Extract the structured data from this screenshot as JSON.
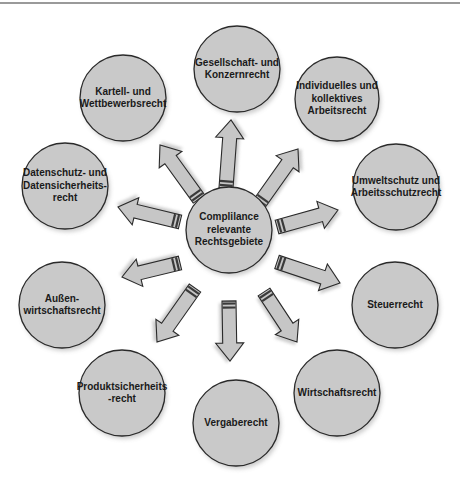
{
  "diagram": {
    "type": "hub-and-spoke",
    "center": {
      "label": "Complilance\nrelevante\nRechtsgebiete",
      "cx": 229,
      "cy": 230,
      "r": 43
    },
    "nodes": [
      {
        "id": "gesellschaft",
        "label": "Gesellschaft- und\nKonzernrecht",
        "cx": 237,
        "cy": 69,
        "r": 43
      },
      {
        "id": "arbeitsrecht",
        "label": "Individuelles und\nkollektives\nArbeitsrecht",
        "cx": 337,
        "cy": 99,
        "r": 42
      },
      {
        "id": "umweltschutz",
        "label": "Umweltschutz und\nArbeitsschutzrecht",
        "cx": 396,
        "cy": 187,
        "r": 43
      },
      {
        "id": "steuerrecht",
        "label": "Steuerrecht",
        "cx": 395,
        "cy": 305,
        "r": 43
      },
      {
        "id": "wirtschaftsrecht",
        "label": "Wirtschaftsrecht",
        "cx": 337,
        "cy": 393,
        "r": 43
      },
      {
        "id": "vergaberecht",
        "label": "Vergaberecht",
        "cx": 236,
        "cy": 423,
        "r": 43
      },
      {
        "id": "produktsicherheit",
        "label": "Produktsicherheits\n-recht",
        "cx": 122,
        "cy": 393,
        "r": 43
      },
      {
        "id": "aussenwirtschaft",
        "label": "Außen-\nwirtschaftsrecht",
        "cx": 62,
        "cy": 305,
        "r": 43
      },
      {
        "id": "datenschutz",
        "label": "Datenschutz- und\nDatensicherheits-\nrecht",
        "cx": 65,
        "cy": 186,
        "r": 43
      },
      {
        "id": "kartellrecht",
        "label": "Kartell- und\nWettbewerbsrecht",
        "cx": 123,
        "cy": 98,
        "r": 43
      }
    ],
    "arrows": [
      {
        "target": "gesellschaft",
        "from": [
          226,
          188
        ],
        "to": [
          231,
          120
        ]
      },
      {
        "target": "arbeitsrecht",
        "from": [
          259,
          204
        ],
        "to": [
          298,
          149
        ]
      },
      {
        "target": "umweltschutz",
        "from": [
          277,
          227
        ],
        "to": [
          338,
          210
        ]
      },
      {
        "target": "steuerrecht",
        "from": [
          277,
          262
        ],
        "to": [
          340,
          283
        ]
      },
      {
        "target": "wirtschaftsrecht",
        "from": [
          264,
          292
        ],
        "to": [
          297,
          342
        ]
      },
      {
        "target": "vergaberecht",
        "from": [
          229,
          301
        ],
        "to": [
          230,
          361
        ]
      },
      {
        "target": "produktsicherheit",
        "from": [
          195,
          288
        ],
        "to": [
          157,
          342
        ]
      },
      {
        "target": "aussenwirtschaft",
        "from": [
          180,
          263
        ],
        "to": [
          122,
          277
        ]
      },
      {
        "target": "datenschutz",
        "from": [
          180,
          222
        ],
        "to": [
          118,
          207
        ]
      },
      {
        "target": "kartellrecht",
        "from": [
          199,
          199
        ],
        "to": [
          160,
          145
        ]
      }
    ],
    "colors": {
      "circle_fill": "#c9c9c9",
      "circle_stroke": "#2a2a2a",
      "arrow_fill": "#c6c6c6",
      "text": "#1a1a1a",
      "background": "#ffffff"
    }
  }
}
